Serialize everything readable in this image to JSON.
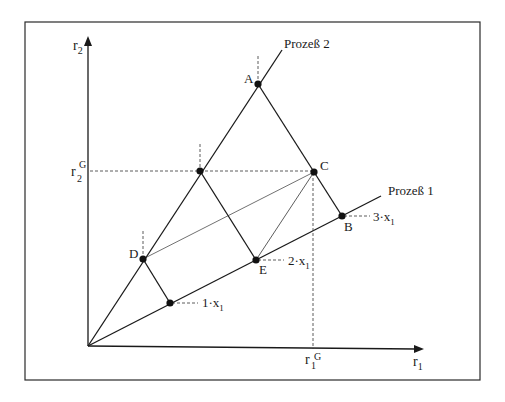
{
  "diagram": {
    "axes": {
      "x_label": "r",
      "x_sub": "1",
      "y_label": "r",
      "y_sub": "2"
    },
    "processes": [
      {
        "label": "Prozeß 1"
      },
      {
        "label": "Prozeß 2"
      }
    ],
    "points": {
      "A": "A",
      "B": "B",
      "C": "C",
      "D": "D",
      "E": "E"
    },
    "levels": [
      {
        "num": "1",
        "dot": "·",
        "var": "x",
        "sub": "1"
      },
      {
        "num": "2",
        "dot": "·",
        "var": "x",
        "sub": "1"
      },
      {
        "num": "3",
        "dot": "·",
        "var": "x",
        "sub": "1"
      }
    ],
    "guides": {
      "r1G": {
        "base": "r",
        "sub": "1",
        "sup": "G"
      },
      "r2G": {
        "base": "r",
        "sub": "2",
        "sup": "G"
      }
    }
  }
}
